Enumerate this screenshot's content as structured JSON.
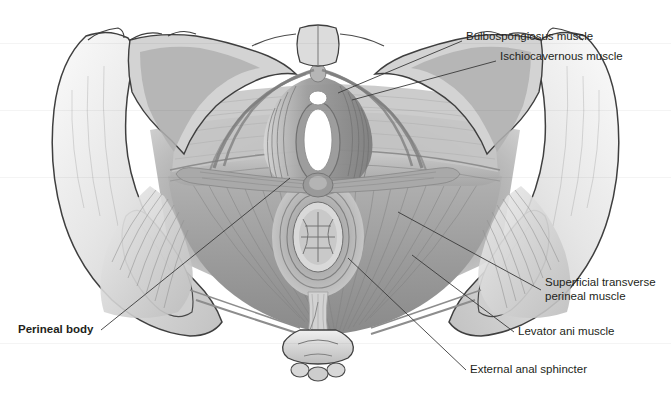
{
  "figure": {
    "view": "inferior view",
    "style": "grayscale medical illustration",
    "background_color": "#ffffff",
    "ink_color": "#231f20",
    "leader_line_color": "#3a3a3a"
  },
  "labels": [
    {
      "id": "bulbospongiosus",
      "text": "Bulbospongiosus muscle",
      "bold": false,
      "x": 466,
      "y": 30,
      "leader": {
        "x1": 462,
        "y1": 41,
        "x2": 338,
        "y2": 93
      }
    },
    {
      "id": "ischiocavernous",
      "text": "Ischiocavernous muscle",
      "bold": false,
      "x": 500,
      "y": 50,
      "leader": {
        "x1": 496,
        "y1": 61,
        "x2": 352,
        "y2": 100
      }
    },
    {
      "id": "superficial-transverse-perineal",
      "text": "Superficial transverse",
      "text2": "perineal muscle",
      "bold": false,
      "x": 545,
      "y": 282,
      "leader": {
        "x1": 541,
        "y1": 290,
        "x2": 398,
        "y2": 212
      }
    },
    {
      "id": "levator-ani",
      "text": "Levator ani muscle",
      "bold": false,
      "x": 518,
      "y": 331,
      "leader": {
        "x1": 514,
        "y1": 332,
        "x2": 412,
        "y2": 255
      }
    },
    {
      "id": "external-anal-sphincter",
      "text": "External anal sphincter",
      "bold": false,
      "x": 470,
      "y": 369,
      "leader": {
        "x1": 466,
        "y1": 370,
        "x2": 348,
        "y2": 258
      }
    },
    {
      "id": "perineal-body",
      "text": "Perineal body",
      "bold": true,
      "x": 18,
      "y": 329,
      "leader": {
        "x1": 101,
        "y1": 330,
        "x2": 290,
        "y2": 178
      }
    }
  ],
  "anatomy_parts": [
    {
      "id": "ilium-left",
      "name": "Left ilium / iliac crest"
    },
    {
      "id": "ilium-right",
      "name": "Right ilium / iliac crest"
    },
    {
      "id": "obturator-foramen-left",
      "name": "Left obturator foramen"
    },
    {
      "id": "obturator-foramen-right",
      "name": "Right obturator foramen"
    },
    {
      "id": "pubic-symphysis",
      "name": "Pubic symphysis"
    },
    {
      "id": "ischial-tuberosity-left",
      "name": "Left ischial tuberosity"
    },
    {
      "id": "ischial-tuberosity-right",
      "name": "Right ischial tuberosity"
    },
    {
      "id": "coccyx",
      "name": "Coccyx"
    },
    {
      "id": "urethral-orifice",
      "name": "External urethral orifice"
    },
    {
      "id": "vaginal-orifice",
      "name": "Vaginal orifice"
    },
    {
      "id": "anus",
      "name": "Anus"
    },
    {
      "id": "perineal-membrane",
      "name": "Perineal membrane"
    },
    {
      "id": "gluteus-maximus-left",
      "name": "Left gluteal muscle fan"
    },
    {
      "id": "gluteus-maximus-right",
      "name": "Right gluteal muscle fan"
    }
  ]
}
